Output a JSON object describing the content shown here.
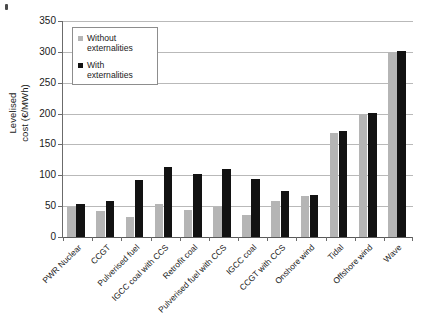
{
  "chart_data": {
    "type": "bar",
    "title": "",
    "xlabel": "",
    "ylabel": "Levelised cost (€/MWh)",
    "ylabel_line1": "Levelised",
    "ylabel_line2": "cost (€/MWh)",
    "ylim": [
      0,
      350
    ],
    "ytick_step": 50,
    "yticks": [
      0,
      50,
      100,
      150,
      200,
      250,
      300,
      350
    ],
    "ytick_labels": [
      "0",
      "50",
      "100",
      "150",
      "200",
      "250",
      "300",
      "350"
    ],
    "grid": "horizontal",
    "legend_position": "top-left-inside",
    "categories": [
      "PWR Nuclear",
      "CCGT",
      "Pulverised fuel",
      "IGCC coal with CCS",
      "Retrofit coal",
      "Pulverised fuel with CCS",
      "IGCC coal",
      "CCGT with CCS",
      "Onshore wind",
      "Tidal",
      "Offshore wind",
      "Wave"
    ],
    "series": [
      {
        "name": "Without externalities",
        "color": "#b5b5b5",
        "values": [
          49,
          42,
          32,
          54,
          43,
          49,
          35,
          58,
          66,
          169,
          200,
          299
        ]
      },
      {
        "name": "With externalities",
        "color": "#121212",
        "values": [
          53,
          59,
          92,
          113,
          102,
          110,
          94,
          75,
          68,
          171,
          201,
          301
        ]
      }
    ]
  },
  "legend": {
    "entries": [
      {
        "label_line1": "Without",
        "label_line2": "externalities"
      },
      {
        "label_line1": "With",
        "label_line2": "externalities"
      }
    ]
  }
}
